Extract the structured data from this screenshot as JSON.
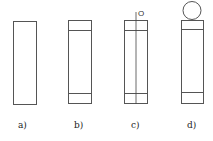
{
  "figure": {
    "panels": [
      {
        "id": "a",
        "label": "a)",
        "rect": {
          "x": 13,
          "y": 21,
          "w": 23,
          "h": 83
        },
        "bands": [],
        "center_line": false,
        "circle": null
      },
      {
        "id": "b",
        "label": "b)",
        "rect": {
          "x": 68,
          "y": 20,
          "w": 23,
          "h": 83
        },
        "bands": [
          30,
          93
        ],
        "center_line": false,
        "circle": null
      },
      {
        "id": "c",
        "label": "c)",
        "rect": {
          "x": 124,
          "y": 20,
          "w": 23,
          "h": 83
        },
        "bands": [
          30,
          93
        ],
        "center_line": true,
        "axis_label": "O",
        "circle": null
      },
      {
        "id": "d",
        "label": "d)",
        "rect": {
          "x": 181,
          "y": 20,
          "w": 22,
          "h": 83
        },
        "bands": [
          29,
          92
        ],
        "center_line": false,
        "circle": {
          "cx": 192,
          "cy": 10,
          "r": 9
        }
      }
    ],
    "stroke_color": "#555555",
    "text_color": "#222222"
  }
}
